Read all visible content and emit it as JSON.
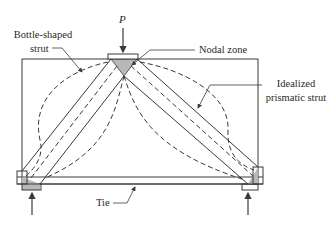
{
  "diagram": {
    "labels": {
      "load": "P",
      "bottle_strut_line1": "Bottle-shaped",
      "bottle_strut_line2": "strut",
      "nodal_zone": "Nodal zone",
      "idealized_line1": "Idealized",
      "idealized_line2": "prismatic strut",
      "tie": "Tie"
    },
    "colors": {
      "line": "#3a3a3a",
      "nodal_fill": "#b8b8b8",
      "background": "#ffffff"
    },
    "elements": [
      {
        "id": "beam",
        "type": "rectangle"
      },
      {
        "id": "load-plate",
        "type": "bearing-plate"
      },
      {
        "id": "left-support",
        "type": "bearing-plate"
      },
      {
        "id": "right-support",
        "type": "bearing-plate"
      },
      {
        "id": "left-strut",
        "type": "idealized-prismatic-strut"
      },
      {
        "id": "right-strut",
        "type": "idealized-prismatic-strut"
      },
      {
        "id": "left-bottle",
        "type": "bottle-shaped-strut"
      },
      {
        "id": "right-bottle",
        "type": "bottle-shaped-strut"
      },
      {
        "id": "tie",
        "type": "tie"
      },
      {
        "id": "top-node",
        "type": "nodal-zone"
      },
      {
        "id": "left-node",
        "type": "nodal-zone"
      },
      {
        "id": "right-node",
        "type": "nodal-zone"
      }
    ]
  }
}
